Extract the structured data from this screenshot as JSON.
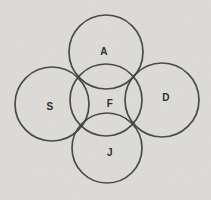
{
  "colors": {
    "background": "#dedcd8",
    "stroke": "#3e3e3e",
    "label": "#2f2f2f"
  },
  "diagram": {
    "type": "overlapping-circles",
    "circles": [
      {
        "label": "A",
        "cx": 106,
        "cy": 52,
        "r": 37,
        "label_x": 104,
        "label_y": 51
      },
      {
        "label": "S",
        "cx": 52,
        "cy": 104,
        "r": 37,
        "label_x": 50,
        "label_y": 106
      },
      {
        "label": "F",
        "cx": 106,
        "cy": 100,
        "r": 36,
        "label_x": 110,
        "label_y": 103
      },
      {
        "label": "D",
        "cx": 162,
        "cy": 100,
        "r": 37,
        "label_x": 166,
        "label_y": 97
      },
      {
        "label": "J",
        "cx": 107,
        "cy": 148,
        "r": 35,
        "label_x": 110,
        "label_y": 152
      }
    ]
  }
}
